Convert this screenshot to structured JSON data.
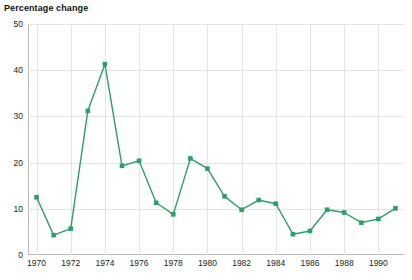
{
  "chart_data": {
    "type": "line",
    "title": "Percentage change",
    "xlabel": "",
    "ylabel": "",
    "xlim": [
      1969.5,
      1991.5
    ],
    "ylim": [
      0,
      50
    ],
    "yticks": [
      0,
      10,
      20,
      30,
      40,
      50
    ],
    "xticks": [
      1970,
      1972,
      1974,
      1976,
      1978,
      1980,
      1982,
      1984,
      1986,
      1988,
      1990
    ],
    "grid": true,
    "legend": "none",
    "series": [
      {
        "name": "Percentage change",
        "color": "#2e9e6b",
        "marker": "square",
        "x": [
          1970,
          1971,
          1972,
          1973,
          1974,
          1975,
          1976,
          1977,
          1978,
          1979,
          1980,
          1981,
          1982,
          1983,
          1984,
          1985,
          1986,
          1987,
          1988,
          1989,
          1990,
          1991
        ],
        "values": [
          12.5,
          4.3,
          5.7,
          31.2,
          41.3,
          19.3,
          20.4,
          11.3,
          8.8,
          20.9,
          18.7,
          12.7,
          9.8,
          11.9,
          11.1,
          4.5,
          5.2,
          9.8,
          9.2,
          7.0,
          7.8,
          10.1
        ]
      }
    ]
  },
  "colors": {
    "series": "#2e9e6b",
    "grid": "#e3e3e3",
    "axis": "#b9b9b9",
    "text": "#222222",
    "title": "#111111"
  }
}
